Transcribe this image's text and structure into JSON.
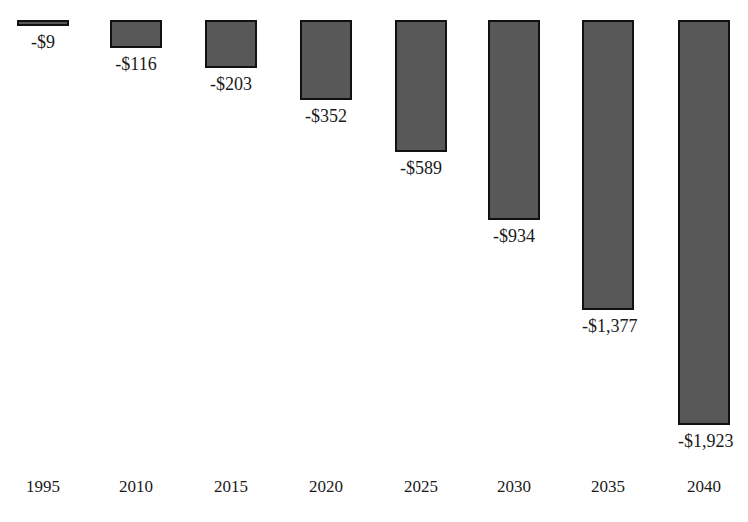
{
  "chart_data": {
    "type": "bar",
    "title": "",
    "subtitle": "",
    "xlabel": "",
    "ylabel": "",
    "orientation": "vertical-downward",
    "grid": false,
    "legend": false,
    "axis_line": false,
    "categories": [
      "1995",
      "2010",
      "2015",
      "2020",
      "2025",
      "2030",
      "2035",
      "2040"
    ],
    "values": [
      -9,
      -116,
      -203,
      -352,
      -589,
      -934,
      -1377,
      -1923
    ],
    "data_labels": [
      "-$9",
      "-$116",
      "-$203",
      "-$352",
      "-$589",
      "-$934",
      "-$1,377",
      "-$1,923"
    ],
    "ylim": [
      -2000,
      0
    ],
    "units": "dollars",
    "bar_fill_color": "#585858",
    "bar_border_color": "#111111",
    "background_color": "#ffffff",
    "text_color": "#1a1a1a"
  },
  "bars": [
    {
      "category": "1995",
      "value": -9,
      "label": "-$9",
      "left": 17,
      "height": 6
    },
    {
      "category": "2010",
      "value": -116,
      "label": "-$116",
      "left": 110,
      "height": 28
    },
    {
      "category": "2015",
      "value": -203,
      "label": "-$203",
      "left": 205,
      "height": 48
    },
    {
      "category": "2020",
      "value": -352,
      "label": "-$352",
      "left": 300,
      "height": 80
    },
    {
      "category": "2025",
      "value": -589,
      "label": "-$589",
      "left": 395,
      "height": 132
    },
    {
      "category": "2030",
      "value": -934,
      "label": "-$934",
      "left": 488,
      "height": 200
    },
    {
      "category": "2035",
      "value": -1377,
      "label": "-$1,377",
      "left": 582,
      "height": 290
    },
    {
      "category": "2040",
      "value": -1923,
      "label": "-$1,923",
      "left": 678,
      "height": 405
    }
  ],
  "axis": {
    "ticks": [
      {
        "label": "1995",
        "left": 17
      },
      {
        "label": "2010",
        "left": 110
      },
      {
        "label": "2015",
        "left": 205
      },
      {
        "label": "2020",
        "left": 300
      },
      {
        "label": "2025",
        "left": 395
      },
      {
        "label": "2030",
        "left": 488
      },
      {
        "label": "2035",
        "left": 582
      },
      {
        "label": "2040",
        "left": 678
      }
    ]
  }
}
